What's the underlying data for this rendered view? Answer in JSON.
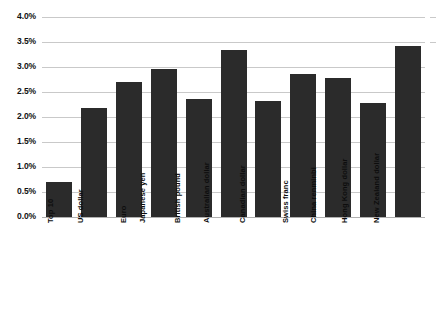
{
  "chart_data": {
    "type": "bar",
    "title": "",
    "subtitle": "",
    "xlabel": "",
    "ylabel": "",
    "ylim": [
      0.0,
      4.0
    ],
    "y_tick_step": 0.5,
    "grid": true,
    "legend": false,
    "bar_color": "#2b2b2b",
    "gridline_color": "#c9c9c9",
    "background_color": "#ffffff",
    "value_unit": "%",
    "categories": [
      "Top 10",
      "US dollar",
      "Euro",
      "Japanese yen",
      "British pound",
      "Australian dollar",
      "Canadian dollar",
      "Swiss franc",
      "China renminbi",
      "Hong Kong dollar",
      "New Zealand dollar"
    ],
    "values": [
      0.7,
      2.18,
      2.7,
      2.97,
      2.36,
      3.35,
      2.32,
      2.87,
      2.78,
      2.28,
      3.42
    ],
    "y_ticks": [
      0.0,
      0.5,
      1.0,
      1.5,
      2.0,
      2.5,
      3.0,
      3.5,
      4.0
    ],
    "y_tick_labels": [
      "0.0%",
      "0.5%",
      "1.0%",
      "1.5%",
      "2.0%",
      "2.5%",
      "3.0%",
      "3.5%",
      "4.0%"
    ]
  }
}
